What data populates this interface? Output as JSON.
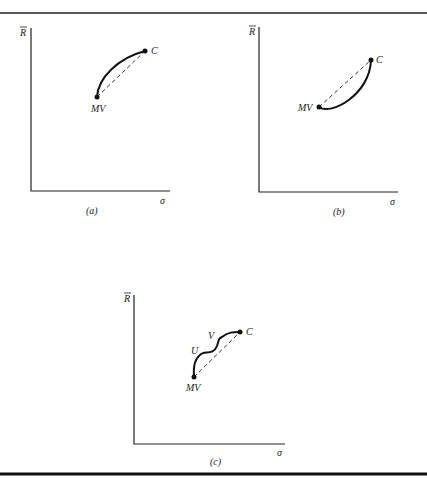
{
  "panels": [
    {
      "id": "a",
      "caption": "(a)",
      "y_label": "R",
      "x_label": "σ",
      "points": {
        "start": "MV",
        "end": "C"
      }
    },
    {
      "id": "b",
      "caption": "(b)",
      "y_label": "R",
      "x_label": "σ",
      "points": {
        "start": "MV",
        "end": "C"
      }
    },
    {
      "id": "c",
      "caption": "(c)",
      "y_label": "R",
      "x_label": "σ",
      "points": {
        "start": "MV",
        "end": "C",
        "inflection1": "U",
        "inflection2": "V"
      }
    }
  ]
}
